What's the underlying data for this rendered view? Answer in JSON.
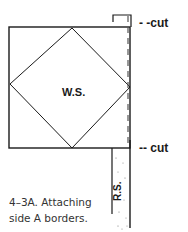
{
  "figure": {
    "center_label": "W.S.",
    "strip_label": "R.S.",
    "top_cut_label": "- -cut",
    "bottom_cut_label": "-- cut",
    "caption_line1": "4–3A. Attaching",
    "caption_line2": "side A borders."
  },
  "colors": {
    "line": "#1a1a1a",
    "dash": "#555555",
    "background": "#ffffff"
  }
}
